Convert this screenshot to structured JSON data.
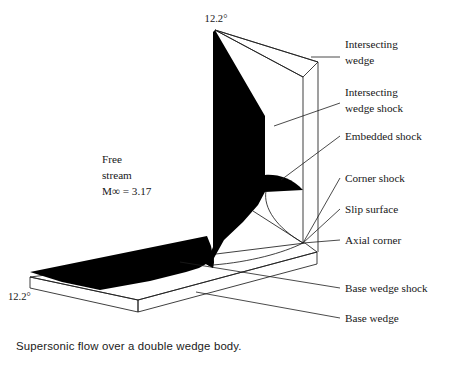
{
  "figure": {
    "caption": "Supersonic flow over a double wedge body.",
    "colors": {
      "background": "#ffffff",
      "ink": "#1d1d1d",
      "shock_fill": "#000000",
      "text": "#171717"
    },
    "angles": {
      "top_wedge_angle": "12.2°",
      "base_wedge_angle": "12.2°"
    },
    "freestream": {
      "line1": "Free",
      "line2": "stream",
      "line3": "M∞ = 3.17"
    },
    "callouts": [
      {
        "id": "intersecting-wedge",
        "line1": "Intersecting",
        "line2": "wedge"
      },
      {
        "id": "intersecting-wedge-shock",
        "line1": "Intersecting",
        "line2": "wedge shock"
      },
      {
        "id": "embedded-shock",
        "line1": "Embedded shock",
        "line2": ""
      },
      {
        "id": "corner-shock",
        "line1": "Corner shock",
        "line2": ""
      },
      {
        "id": "slip-surface",
        "line1": "Slip surface",
        "line2": ""
      },
      {
        "id": "axial-corner",
        "line1": "Axial corner",
        "line2": ""
      },
      {
        "id": "base-wedge-shock",
        "line1": "Base wedge shock",
        "line2": ""
      },
      {
        "id": "base-wedge",
        "line1": "Base wedge",
        "line2": ""
      }
    ]
  }
}
